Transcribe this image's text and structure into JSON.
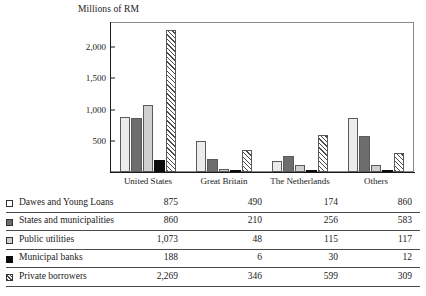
{
  "chart_data": {
    "type": "bar",
    "title": "Millions of RM",
    "xlabel": "",
    "ylabel": "Millions of RM",
    "ylim": [
      0,
      2400
    ],
    "yticks": [
      "500",
      "1,000",
      "1,500",
      "2,000"
    ],
    "ytick_values": [
      500,
      1000,
      1500,
      2000
    ],
    "grid": false,
    "legend_position": "table-below",
    "categories": [
      "United States",
      "Great Britain",
      "The Netherlands",
      "Others"
    ],
    "series": [
      {
        "name": "Dawes and Young Loans",
        "swatch": "white-square",
        "values": [
          875,
          490,
          174,
          860
        ],
        "labels": [
          "875",
          "490",
          "174",
          "860"
        ]
      },
      {
        "name": "States and municipalities",
        "swatch": "dark-gray-square",
        "values": [
          860,
          210,
          256,
          583
        ],
        "labels": [
          "860",
          "210",
          "256",
          "583"
        ]
      },
      {
        "name": "Public utilities",
        "swatch": "light-gray-square",
        "values": [
          1073,
          48,
          115,
          117
        ],
        "labels": [
          "1,073",
          "48",
          "115",
          "117"
        ]
      },
      {
        "name": "Municipal banks",
        "swatch": "black-square",
        "values": [
          188,
          6,
          30,
          12
        ],
        "labels": [
          "188",
          "6",
          "30",
          "12"
        ]
      },
      {
        "name": "Private borrowers",
        "swatch": "hatched-square",
        "values": [
          2269,
          346,
          599,
          309
        ],
        "labels": [
          "2,269",
          "346",
          "599",
          "309"
        ]
      }
    ]
  },
  "colors": {
    "series_1": "#ececec",
    "series_2": "#6d6d6d",
    "series_3": "#cfcfcf",
    "series_4": "#0d0d0d",
    "series_5_hatch": "#4a4a4a",
    "axis": "#1a1a1a",
    "frame": "#8a8a8a",
    "rule": "#4a4a4a"
  }
}
